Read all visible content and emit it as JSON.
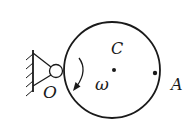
{
  "diagram": {
    "type": "rigid body rotating about fixed pivot",
    "labels": {
      "pivot": "O",
      "center": "C",
      "point": "A",
      "angular_velocity": "ω"
    },
    "colors": {
      "stroke": "#1a1a1a",
      "background": "#ffffff"
    }
  }
}
